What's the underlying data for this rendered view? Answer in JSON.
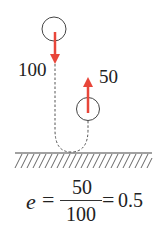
{
  "diagram": {
    "labels": {
      "incoming_speed": "100",
      "outgoing_speed": "50"
    },
    "equation": {
      "symbol": "e",
      "equals": "=",
      "numerator": "50",
      "denominator": "100",
      "equals2": "=",
      "result": "0.5"
    },
    "colors": {
      "arrow": "#e8463a",
      "outline": "#444444",
      "dashed_path": "#555555",
      "hatch": "#555555"
    }
  }
}
